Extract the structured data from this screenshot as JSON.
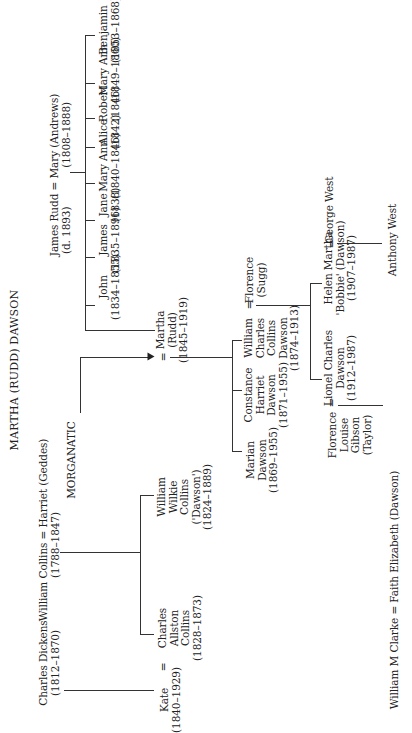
{
  "title": "MARTHA (RUDD) DAWSON",
  "rudd_parents": {
    "line1": "James Rudd = Mary (Andrews)",
    "line2": "(d. 1893)            (1808–1888)"
  },
  "rudd_children": [
    {
      "name": "John",
      "dates": "(1834–1855)"
    },
    {
      "name": "James",
      "dates": "(1835–1896)"
    },
    {
      "name": "Jane",
      "dates": "(1838)"
    },
    {
      "name": "Mary Ann",
      "dates": "(1840–1846)"
    },
    {
      "name": "Alice",
      "dates": "(1842)"
    },
    {
      "name": "Robert",
      "dates": "(1846)"
    },
    {
      "name": "Mary Ann",
      "dates": "(1849–1860)"
    },
    {
      "name": "Benjamin",
      "dates": "(1853–1868)"
    }
  ],
  "martha": "Martha\n(Rudd)\n(1845–1919)",
  "collins_parents": {
    "line1": "William Collins = Harriet (Geddes)",
    "line2": "(1788–1847)"
  },
  "dickens": {
    "name": "Charles Dickens",
    "dates": "(1812–1870)"
  },
  "morganatic_label": "MORGANATIC",
  "kate": "Kate\n(1840–1929)",
  "charles_collins": "Charles\nAllston\nCollins\n(1828–1873)",
  "wilkie": "William\nWilkie\nCollins\n('Dawson')\n(1824–1889)",
  "equals": "=",
  "dawson_children": [
    "Marian\nDawson\n(1869–1955)",
    "Constance\nHarriet\nDawson\n(1871–1955)",
    "William\nCharles\nCollins\nDawson\n(1874–1913)"
  ],
  "florence_sugg": "Florence\n(Sugg)",
  "grandchildren": [
    "Lionel Charles\nDawson\n(1912–1987)",
    "Helen Martha\n'Bobbie' (Dawson)\n(1907–1987)"
  ],
  "florence_taylor": "Florence\nLouise\nGibson\n(Taylor)",
  "george_west": "George West",
  "anthony_west": "Anthony West",
  "clarke_marriage": "William M Clarke = Faith Elizabeth (Dawson)"
}
